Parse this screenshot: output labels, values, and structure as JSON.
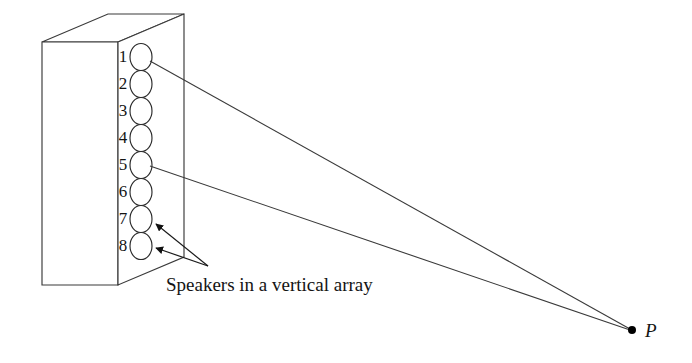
{
  "figure": {
    "title": "Speakers in a vertical array",
    "caption": "Speakers in a vertical array",
    "background_color": "#ffffff",
    "line_color": "#3a3a3a",
    "text_color": "#141414"
  },
  "speakers": [
    {
      "label": "1",
      "cy": 57,
      "has_ray": true
    },
    {
      "label": "2",
      "cy": 84,
      "has_ray": false
    },
    {
      "label": "3",
      "cy": 111,
      "has_ray": false
    },
    {
      "label": "4",
      "cy": 138,
      "has_ray": false
    },
    {
      "label": "5",
      "cy": 165,
      "has_ray": true
    },
    {
      "label": "6",
      "cy": 192,
      "has_ray": false
    },
    {
      "label": "7",
      "cy": 219,
      "has_ray": false
    },
    {
      "label": "8",
      "cy": 246,
      "has_ray": false
    }
  ],
  "point": {
    "label": "P",
    "x": 632,
    "y": 330
  },
  "geometry": {
    "cabinet_front_top_left": "42,42",
    "cabinet_front_bottom_left": "42,285",
    "cabinet_front_right_x": 118,
    "cabinet_top_back_apex": "108,14",
    "speaker_center_x": 141,
    "number_label_x": 123,
    "leader_origin_x": 208,
    "leader_origin_y": 266
  },
  "labels": {
    "speaker_1": "1",
    "speaker_2": "2",
    "speaker_3": "3",
    "speaker_4": "4",
    "speaker_5": "5",
    "speaker_6": "6",
    "speaker_7": "7",
    "speaker_8": "8",
    "point_p": "P",
    "caption": "Speakers in a vertical array"
  }
}
